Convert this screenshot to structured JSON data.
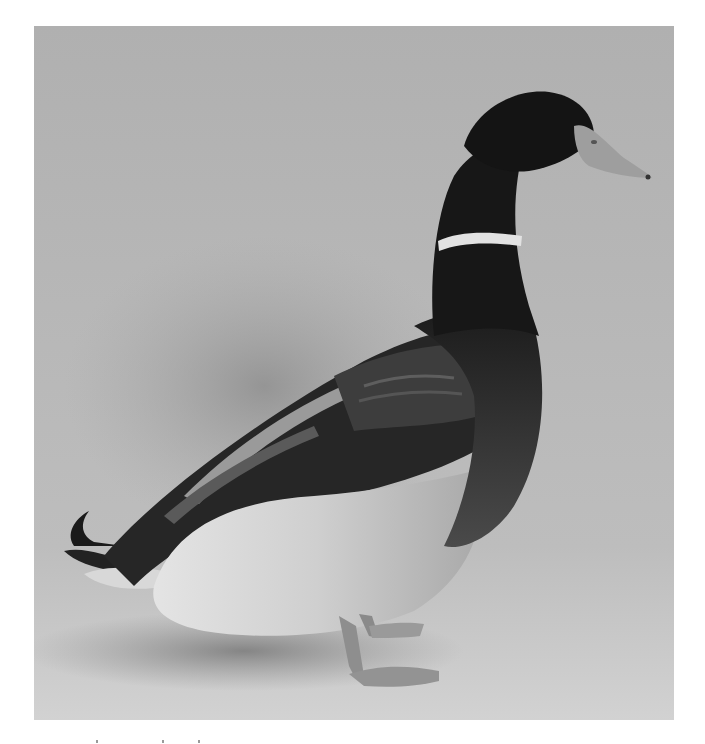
{
  "image": {
    "subject": "mallard drake standing in profile",
    "style": "grayscale photograph",
    "colors": {
      "background_top": "#b3b3b3",
      "background_floor": "#cfcfcf",
      "head": "#161616",
      "neck_ring": "#e6e6e6",
      "bill": "#9c9c9c",
      "breast": "#3a3a3a",
      "wing": "#2a2a2a",
      "belly": "#dcdcdc",
      "feet": "#8e8e8e",
      "shadow": "#8a8a8a"
    }
  }
}
